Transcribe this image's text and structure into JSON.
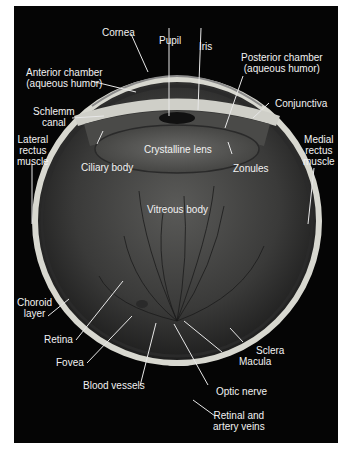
{
  "diagram": {
    "labels": {
      "cornea": "Cornea",
      "pupil": "Pupil",
      "iris": "Iris",
      "anterior_chamber_1": "Anterior chamber",
      "anterior_chamber_2": "(aqueous humor)",
      "posterior_chamber_1": "Posterior chamber",
      "posterior_chamber_2": "(aqueous humor)",
      "schlemm_1": "Schlemm",
      "schlemm_2": "canal",
      "conjunctiva": "Conjunctiva",
      "lateral_1": "Lateral",
      "lateral_2": "rectus",
      "lateral_3": "muscle",
      "medial_1": "Medial",
      "medial_2": "rectus",
      "medial_3": "muscle",
      "ciliary_body": "Ciliary body",
      "crystalline_lens": "Crystalline lens",
      "zonules": "Zonules",
      "vitreous_body": "Vitreous body",
      "choroid_1": "Choroid",
      "choroid_2": "layer",
      "retina": "Retina",
      "fovea": "Fovea",
      "blood_vessels": "Blood vessels",
      "macula": "Macula",
      "sclera": "Sclera",
      "optic_nerve": "Optic nerve",
      "retinal_veins_1": "Retinal and",
      "retinal_veins_2": "artery veins"
    },
    "colors": {
      "background": "#050505",
      "sclera": "#d8d8d0",
      "label_text": "#f2f2f2",
      "leader_line": "#e8e8e8"
    }
  }
}
